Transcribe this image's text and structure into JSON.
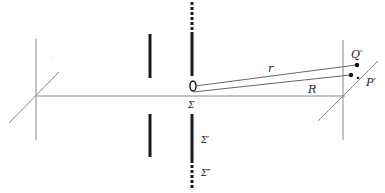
{
  "diagram": {
    "labels": {
      "r": "r",
      "R": "R",
      "Q_prime": "Q′",
      "P_prime": "P′",
      "sigma": "Σ",
      "sigma_prime": "Σ′",
      "sigma_double_prime": "Σ″"
    },
    "colors": {
      "line": "#888888",
      "screen": "#1a1a1a",
      "point": "#111111"
    }
  }
}
